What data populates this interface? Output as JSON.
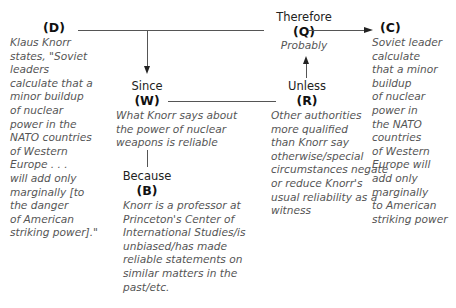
{
  "diagram": {
    "type": "Toulmin argument model",
    "data": {
      "label": "(D)",
      "text": "Klaus Knorr\nstates, \"Soviet\nleaders\ncalculate that a\nminor buildup\nof nuclear\npower in the\nNATO countries\nof Western\nEurope . . .\nwill add only\nmarginally [to\nthe danger\nof American\nstriking power].\""
    },
    "qualifier": {
      "keyword": "Therefore",
      "label": "(Q)",
      "text": "Probably"
    },
    "claim": {
      "label": "(C)",
      "text": "Soviet leader\ncalculate\nthat a minor\nbuildup\nof nuclear\npower in\nthe NATO\ncountries\nof Western\nEurope will\nadd only\nmarginally\nto American\nstriking power"
    },
    "warrant": {
      "keyword": "Since",
      "label": "(W)",
      "text": "What Knorr says about\nthe power of nuclear\nweapons is reliable"
    },
    "rebuttal": {
      "keyword": "Unless",
      "label": "(R)",
      "text": "Other authorities\nmore qualified\nthan Knorr say\notherwise/special\ncircumstances negate\nor reduce Knorr's\nusual reliability as a\nwitness"
    },
    "backing": {
      "keyword": "Because",
      "label": "(B)",
      "text": "Knorr is a professor at\nPrinceton's Center of\nInternational Studies/is\nunbiased/has made\nreliable statements on\nsimilar matters in the\npast/etc."
    }
  }
}
